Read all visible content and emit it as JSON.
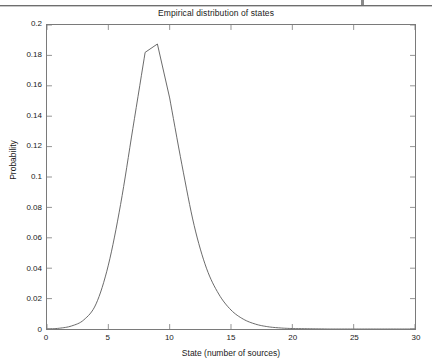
{
  "figure": {
    "title": "Empirical distribution of states",
    "background_color": "#ffffff",
    "axes_color": "#7a7a7a",
    "line_color": "#5a5a5a",
    "text_color": "#1a1a1a"
  },
  "artifact": {
    "description": "scan-edge-line"
  },
  "chart_data": {
    "type": "line",
    "title": "Empirical distribution of states",
    "xlabel": "State (number of sources)",
    "ylabel": "Probability",
    "xlim": [
      0,
      30
    ],
    "ylim": [
      0,
      0.2
    ],
    "grid": false,
    "legend": null,
    "xticks": [
      0,
      5,
      10,
      15,
      20,
      25,
      30
    ],
    "xtick_labels": [
      "0",
      "5",
      "10",
      "15",
      "20",
      "25",
      "30"
    ],
    "yticks": [
      0,
      0.02,
      0.04,
      0.06,
      0.08,
      0.1,
      0.12,
      0.14,
      0.16,
      0.18,
      0.2
    ],
    "ytick_labels": [
      "0",
      "0.02",
      "0.04",
      "0.06",
      "0.08",
      "0.1",
      "0.12",
      "0.14",
      "0.16",
      "0.18",
      "0.2"
    ],
    "series": [
      {
        "name": "Empirical distribution",
        "color": "#5a5a5a",
        "x": [
          0,
          1,
          2,
          3,
          4,
          5,
          6,
          7,
          8,
          9,
          10,
          11,
          12,
          13,
          14,
          15,
          16,
          17,
          18,
          19,
          20,
          21,
          22,
          23,
          24,
          25,
          26,
          27,
          28,
          29,
          30
        ],
        "values": [
          0.0,
          0.0005,
          0.002,
          0.006,
          0.0165,
          0.042,
          0.082,
          0.132,
          0.182,
          0.1875,
          0.152,
          0.108,
          0.068,
          0.04,
          0.023,
          0.0125,
          0.0065,
          0.0032,
          0.0015,
          0.0007,
          0.0003,
          0.0002,
          0.0001,
          0.0,
          0.0,
          0.0,
          0.0,
          0.0,
          0.0,
          0.0,
          0.0
        ]
      }
    ],
    "peak": {
      "x": 9,
      "y": 0.1875
    }
  }
}
